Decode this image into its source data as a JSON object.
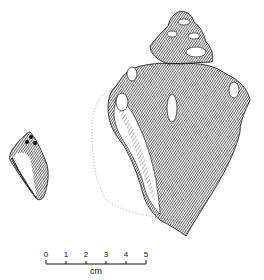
{
  "figure": {
    "small_shell": {
      "label": "small-shell-illustration"
    },
    "large_shell": {
      "label": "large-shell-illustration"
    },
    "scale_bar": {
      "ticks": [
        "0",
        "1",
        "2",
        "3",
        "4",
        "5"
      ],
      "unit": "cm"
    }
  },
  "colors": {
    "ink": "#111111",
    "paper": "#ffffff",
    "dotted": "#9a9a9a"
  }
}
